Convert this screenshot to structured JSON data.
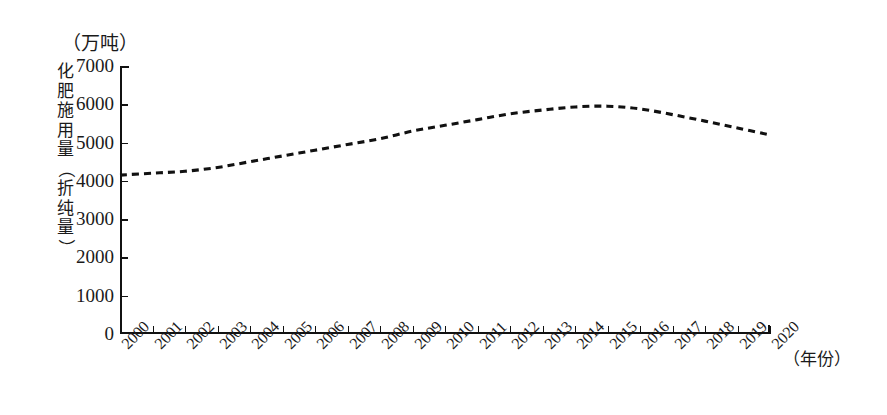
{
  "chart_data": {
    "type": "line",
    "title": "",
    "unit_label": "（万吨）",
    "ylabel": "化肥施用量（折纯量）",
    "xlabel": "（年份）",
    "x": [
      2000,
      2001,
      2002,
      2003,
      2004,
      2005,
      2006,
      2007,
      2008,
      2009,
      2010,
      2011,
      2012,
      2013,
      2014,
      2015,
      2016,
      2017,
      2018,
      2019,
      2020
    ],
    "categories": [
      "2000",
      "2001",
      "2002",
      "2003",
      "2004",
      "2005",
      "2006",
      "2007",
      "2008",
      "2009",
      "2010",
      "2011",
      "2012",
      "2013",
      "2014",
      "2015",
      "2016",
      "2017",
      "2018",
      "2019",
      "2020"
    ],
    "values": [
      4150,
      4200,
      4250,
      4350,
      4500,
      4650,
      4800,
      4950,
      5100,
      5300,
      5450,
      5600,
      5750,
      5850,
      5930,
      5950,
      5880,
      5730,
      5560,
      5380,
      5200
    ],
    "ylim": [
      0,
      7000
    ],
    "xlim": [
      2000,
      2020
    ],
    "yticks": [
      0,
      1000,
      2000,
      3000,
      4000,
      5000,
      6000,
      7000
    ],
    "ytick_labels": [
      "0",
      "1000",
      "2000",
      "3000",
      "4000",
      "5000",
      "6000",
      "7000"
    ],
    "grid": false,
    "legend": "none",
    "line_style": "dashed",
    "line_color": "#111111",
    "markers": false
  },
  "axes": {
    "y_title_chars": [
      "化",
      "肥",
      "施",
      "用",
      "量",
      "（",
      "折",
      "纯",
      "量",
      "）"
    ],
    "unit": "（万吨）",
    "x_title": "（年份）"
  }
}
